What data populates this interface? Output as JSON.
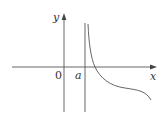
{
  "diagram": {
    "type": "function-graph",
    "axes": {
      "x_label": "x",
      "y_label": "y",
      "origin_label": "0"
    },
    "asymptote": {
      "orientation": "vertical",
      "label": "a"
    },
    "curve": {
      "description": "decreasing curve with vertical asymptote at x=a, crossing x-axis right of a, inflecting and decreasing to the right"
    },
    "colors": {
      "line": "#555555",
      "curve": "#555555"
    }
  }
}
